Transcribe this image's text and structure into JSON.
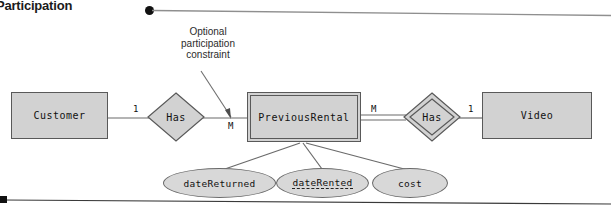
{
  "slide": {
    "heading": "Participation",
    "bullet_marker": "•"
  },
  "callout": {
    "line1": "Optional",
    "line2": "participation",
    "line3": "constraint"
  },
  "diagram": {
    "type": "entity-relationship-diagram",
    "entities": [
      {
        "id": "customer",
        "label": "Customer",
        "kind": "strong"
      },
      {
        "id": "previousrental",
        "label": "PreviousRental",
        "kind": "weak"
      },
      {
        "id": "video",
        "label": "Video",
        "kind": "strong"
      }
    ],
    "relationships": [
      {
        "id": "has-left",
        "label": "Has",
        "kind": "regular"
      },
      {
        "id": "has-right",
        "label": "Has",
        "kind": "identifying"
      }
    ],
    "cardinalities": {
      "customer_to_has_left": "1",
      "has_left_to_previousrental": "M",
      "previousrental_to_has_right": "M",
      "has_right_to_video": "1"
    },
    "attributes": [
      {
        "id": "datereturned",
        "label": "dateReturned",
        "key": "none"
      },
      {
        "id": "daterented",
        "label": "dateRented",
        "key": "partial"
      },
      {
        "id": "cost",
        "label": "cost",
        "key": "none"
      }
    ]
  },
  "colors": {
    "entity_fill": "#d2d2d2",
    "attribute_fill": "#d8d8d8",
    "stroke": "#595959",
    "text": "#111111",
    "rule": "#8a8a8a"
  }
}
